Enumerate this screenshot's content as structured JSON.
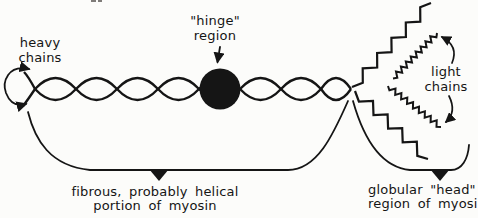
{
  "colors": {
    "ink": "#151515",
    "paper": "#fcfcfa"
  },
  "diagram": {
    "hinge_label": {
      "line1": "\"hinge\"",
      "line2": "region"
    },
    "heavy_chains_label": {
      "line1": "heavy",
      "line2": "chains"
    },
    "light_chains_label": {
      "line1": "light",
      "line2": "chains"
    },
    "fibrous_label": {
      "line1": "fibrous, probably helical",
      "line2": "portion of myosin"
    },
    "head_label": {
      "line1": "globular \"head\"",
      "line2": "region of myosin"
    }
  }
}
